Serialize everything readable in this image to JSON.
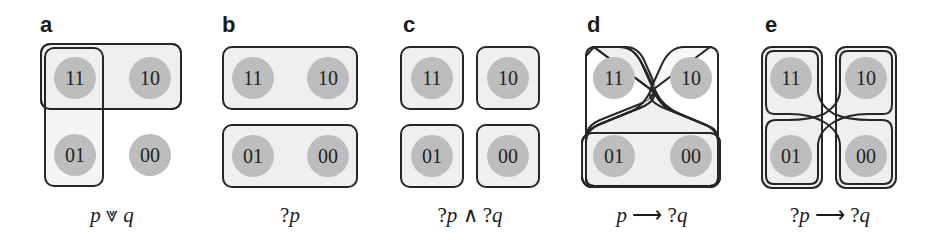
{
  "figure": {
    "panels": [
      {
        "letter": "a",
        "caption": {
          "p1": "p",
          "op": " ⩔ ",
          "p2": "q"
        },
        "states": [
          "11",
          "10",
          "01",
          "00"
        ]
      },
      {
        "letter": "b",
        "caption": {
          "q1": "?",
          "p1": "p"
        },
        "states": [
          "11",
          "10",
          "01",
          "00"
        ]
      },
      {
        "letter": "c",
        "caption": {
          "q1": "?",
          "p1": "p",
          "op": " ∧ ",
          "q2": "?",
          "p2": "q"
        },
        "states": [
          "11",
          "10",
          "01",
          "00"
        ]
      },
      {
        "letter": "d",
        "caption": {
          "p1": "p",
          "op": " ⟶ ",
          "q2": "?",
          "p2": "q"
        },
        "states": [
          "11",
          "10",
          "01",
          "00"
        ]
      },
      {
        "letter": "e",
        "caption": {
          "q1": "?",
          "p1": "p",
          "op": " ⟶ ",
          "q2": "?",
          "p2": "q"
        },
        "states": [
          "11",
          "10",
          "01",
          "00"
        ]
      }
    ],
    "colors": {
      "circle_fill": "#bdbdbd",
      "box_fill": "#efefef",
      "stroke": "#262626"
    }
  }
}
